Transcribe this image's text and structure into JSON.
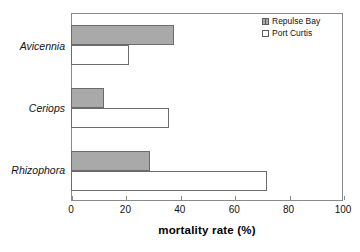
{
  "chart_data": {
    "type": "bar",
    "orientation": "horizontal",
    "title": "",
    "xlabel": "mortality rate (%)",
    "ylabel": "",
    "xlim": [
      0,
      100
    ],
    "xticks": [
      0,
      20,
      40,
      60,
      80,
      100
    ],
    "xtick_labels": [
      "0",
      "20",
      "40",
      "60",
      "80",
      "100"
    ],
    "grid": false,
    "legend_position": "top-right",
    "categories": [
      "Avicennia",
      "Ceriops",
      "Rhizophora"
    ],
    "series": [
      {
        "name": "Repulse Bay",
        "fill": "#a9a9a9",
        "values": [
          38,
          12,
          29
        ]
      },
      {
        "name": "Port Curtis",
        "fill": "#ffffff",
        "values": [
          21.5,
          36,
          72
        ]
      }
    ]
  },
  "legend": {
    "items": [
      {
        "label": "Repulse Bay",
        "swatch": "filled-square-icon"
      },
      {
        "label": "Port Curtis",
        "swatch": "open-square-icon"
      }
    ]
  }
}
